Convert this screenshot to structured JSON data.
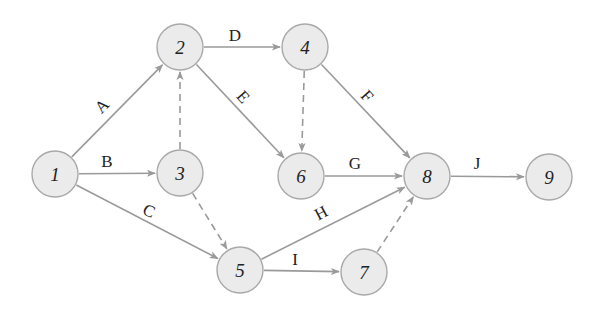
{
  "diagram": {
    "type": "activity-on-arrow network",
    "colors": {
      "node_fill": "#ebebeb",
      "node_stroke": "#a9a9a9",
      "edge": "#9a9a9a",
      "text": "#222222"
    },
    "nodes": [
      {
        "id": "1",
        "label": "1",
        "x": 55,
        "y": 174
      },
      {
        "id": "2",
        "label": "2",
        "x": 180,
        "y": 47
      },
      {
        "id": "3",
        "label": "3",
        "x": 180,
        "y": 173
      },
      {
        "id": "4",
        "label": "4",
        "x": 305,
        "y": 47
      },
      {
        "id": "5",
        "label": "5",
        "x": 240,
        "y": 270
      },
      {
        "id": "6",
        "label": "6",
        "x": 301,
        "y": 176
      },
      {
        "id": "7",
        "label": "7",
        "x": 364,
        "y": 272
      },
      {
        "id": "8",
        "label": "8",
        "x": 427,
        "y": 176
      },
      {
        "id": "9",
        "label": "9",
        "x": 549,
        "y": 177
      }
    ],
    "edges": [
      {
        "from": "1",
        "to": "2",
        "label": "A",
        "dashed": false,
        "lx": 102,
        "ly": 106,
        "rot": -45
      },
      {
        "from": "1",
        "to": "3",
        "label": "B",
        "dashed": false,
        "lx": 107,
        "ly": 161,
        "rot": 0
      },
      {
        "from": "1",
        "to": "5",
        "label": "C",
        "dashed": false,
        "lx": 149,
        "ly": 211,
        "rot": 25
      },
      {
        "from": "2",
        "to": "4",
        "label": "D",
        "dashed": false,
        "lx": 235,
        "ly": 35,
        "rot": 0
      },
      {
        "from": "2",
        "to": "6",
        "label": "E",
        "dashed": false,
        "lx": 243,
        "ly": 97,
        "rot": 48
      },
      {
        "from": "4",
        "to": "8",
        "label": "F",
        "dashed": false,
        "lx": 367,
        "ly": 96,
        "rot": 48
      },
      {
        "from": "6",
        "to": "8",
        "label": "G",
        "dashed": false,
        "lx": 355,
        "ly": 163,
        "rot": 0
      },
      {
        "from": "5",
        "to": "8",
        "label": "H",
        "dashed": false,
        "lx": 321,
        "ly": 213,
        "rot": -28
      },
      {
        "from": "5",
        "to": "7",
        "label": "I",
        "dashed": false,
        "lx": 295,
        "ly": 259,
        "rot": 0
      },
      {
        "from": "8",
        "to": "9",
        "label": "J",
        "dashed": false,
        "lx": 477,
        "ly": 163,
        "rot": 0
      },
      {
        "from": "3",
        "to": "2",
        "label": "",
        "dashed": true
      },
      {
        "from": "3",
        "to": "5",
        "label": "",
        "dashed": true
      },
      {
        "from": "4",
        "to": "6",
        "label": "",
        "dashed": true
      },
      {
        "from": "7",
        "to": "8",
        "label": "",
        "dashed": true
      }
    ],
    "node_radius": 23
  }
}
